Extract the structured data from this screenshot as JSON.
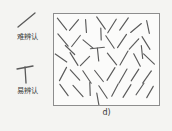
{
  "figure": {
    "caption": "d)",
    "background_color": "#f4f4f2",
    "stroke_color": "#5a5a5a",
    "border_color": "#8d8d8d"
  },
  "legend": {
    "entries": [
      {
        "id": "hard",
        "label": "难辨认",
        "glyph_name": "tilted-line-glyph",
        "glyph_type": "slash",
        "angle_deg": -42
      },
      {
        "id": "easy",
        "label": "易辨认",
        "glyph_name": "t-shape-glyph",
        "glyph_type": "tee",
        "angle_deg": -8
      }
    ]
  },
  "array": {
    "target": {
      "shape": "T",
      "x": 44,
      "y": 40,
      "angle_deg": -6
    },
    "distractors": [
      {
        "x": 8,
        "y": 10,
        "len": 15,
        "angle": 52
      },
      {
        "x": 20,
        "y": 11,
        "len": 14,
        "angle": -50
      },
      {
        "x": 32,
        "y": 12,
        "len": 13,
        "angle": 86
      },
      {
        "x": 47,
        "y": 9,
        "len": 15,
        "angle": 55
      },
      {
        "x": 58,
        "y": 12,
        "len": 16,
        "angle": -58
      },
      {
        "x": 70,
        "y": 10,
        "len": 15,
        "angle": -55
      },
      {
        "x": 82,
        "y": 14,
        "len": 14,
        "angle": -40
      },
      {
        "x": 94,
        "y": 13,
        "len": 13,
        "angle": 78
      },
      {
        "x": 9,
        "y": 26,
        "len": 16,
        "angle": 50
      },
      {
        "x": 22,
        "y": 27,
        "len": 14,
        "angle": -52
      },
      {
        "x": 34,
        "y": 30,
        "len": 13,
        "angle": 40
      },
      {
        "x": 56,
        "y": 28,
        "len": 15,
        "angle": 56
      },
      {
        "x": 68,
        "y": 27,
        "len": 16,
        "angle": -56
      },
      {
        "x": 80,
        "y": 30,
        "len": 14,
        "angle": -48
      },
      {
        "x": 92,
        "y": 29,
        "len": 15,
        "angle": 58
      },
      {
        "x": 7,
        "y": 44,
        "len": 14,
        "angle": 35
      },
      {
        "x": 20,
        "y": 45,
        "len": 15,
        "angle": 58
      },
      {
        "x": 31,
        "y": 47,
        "len": 13,
        "angle": -45
      },
      {
        "x": 58,
        "y": 45,
        "len": 15,
        "angle": 52
      },
      {
        "x": 70,
        "y": 44,
        "len": 16,
        "angle": -60
      },
      {
        "x": 83,
        "y": 46,
        "len": 14,
        "angle": 62
      },
      {
        "x": 95,
        "y": 45,
        "len": 15,
        "angle": 44
      },
      {
        "x": 9,
        "y": 60,
        "len": 15,
        "angle": -62
      },
      {
        "x": 21,
        "y": 61,
        "len": 14,
        "angle": 48
      },
      {
        "x": 33,
        "y": 63,
        "len": 15,
        "angle": 56
      },
      {
        "x": 45,
        "y": 62,
        "len": 14,
        "angle": 52
      },
      {
        "x": 57,
        "y": 60,
        "len": 15,
        "angle": -58
      },
      {
        "x": 69,
        "y": 62,
        "len": 16,
        "angle": -60
      },
      {
        "x": 81,
        "y": 61,
        "len": 14,
        "angle": -57
      },
      {
        "x": 93,
        "y": 63,
        "len": 15,
        "angle": -55
      },
      {
        "x": 10,
        "y": 76,
        "len": 14,
        "angle": 54
      },
      {
        "x": 24,
        "y": 77,
        "len": 15,
        "angle": 48
      },
      {
        "x": 36,
        "y": 75,
        "len": 13,
        "angle": 88
      },
      {
        "x": 49,
        "y": 78,
        "len": 15,
        "angle": 56
      },
      {
        "x": 61,
        "y": 76,
        "len": 14,
        "angle": -62
      },
      {
        "x": 73,
        "y": 77,
        "len": 15,
        "angle": -58
      },
      {
        "x": 86,
        "y": 75,
        "len": 14,
        "angle": -56
      },
      {
        "x": 96,
        "y": 78,
        "len": 13,
        "angle": -60
      },
      {
        "x": 44,
        "y": 86,
        "len": 14,
        "angle": 80
      },
      {
        "x": 16,
        "y": 36,
        "len": 13,
        "angle": 44
      },
      {
        "x": 47,
        "y": 20,
        "len": 12,
        "angle": 88
      },
      {
        "x": 88,
        "y": 38,
        "len": 13,
        "angle": 84
      }
    ]
  }
}
